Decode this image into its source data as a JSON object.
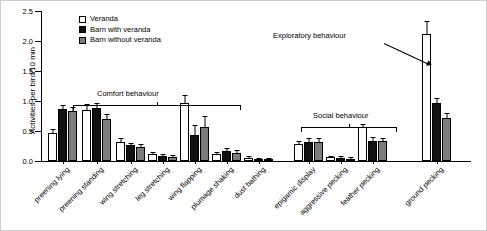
{
  "chart_data": {
    "type": "bar",
    "title": "",
    "xlabel": "",
    "ylabel": "Activities per bird/10 min",
    "ylim": [
      0,
      2.5
    ],
    "yticks": [
      "0.0",
      "0.5",
      "1.0",
      "1.5",
      "2.0",
      "2.5"
    ],
    "grid": false,
    "legend_position": "top-left-inside",
    "categories": [
      "preening lying",
      "preening standing",
      "wing stretching",
      "leg stretching",
      "wing flapping",
      "plumage shaking",
      "dust bathing",
      "epigamic display",
      "aggressive pecking",
      "feather pecking",
      "ground pecking"
    ],
    "series": [
      {
        "name": "Veranda",
        "color": "#ffffff",
        "values": [
          0.47,
          0.85,
          0.32,
          0.12,
          0.97,
          0.11,
          0.05,
          0.28,
          0.06,
          0.56,
          2.12
        ],
        "errors": [
          0.04,
          0.08,
          0.04,
          0.02,
          0.12,
          0.02,
          0.01,
          0.04,
          0.01,
          0.04,
          0.2
        ]
      },
      {
        "name": "Barn with veranda",
        "color": "#111111",
        "values": [
          0.86,
          0.88,
          0.26,
          0.08,
          0.44,
          0.17,
          0.03,
          0.31,
          0.05,
          0.34,
          0.97
        ],
        "errors": [
          0.06,
          0.07,
          0.03,
          0.02,
          0.14,
          0.03,
          0.01,
          0.05,
          0.01,
          0.04,
          0.06
        ]
      },
      {
        "name": "Barn without veranda",
        "color": "#7d7d7d",
        "values": [
          0.83,
          0.7,
          0.24,
          0.07,
          0.57,
          0.14,
          0.02,
          0.32,
          0.04,
          0.33,
          0.72
        ],
        "errors": [
          0.06,
          0.06,
          0.03,
          0.02,
          0.17,
          0.03,
          0.01,
          0.05,
          0.01,
          0.04,
          0.07
        ]
      }
    ],
    "annotations": [
      {
        "name": "comfort-behaviour",
        "text": "Comfort behaviour"
      },
      {
        "name": "social-behaviour",
        "text": "Social behaviour"
      },
      {
        "name": "exploratory-behaviour",
        "text": "Exploratory behaviour"
      }
    ]
  }
}
